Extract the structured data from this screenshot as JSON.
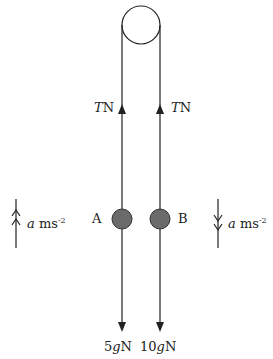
{
  "diagram": {
    "type": "pulley-system",
    "pulley": {
      "cx": 141,
      "cy": 25,
      "r": 19
    },
    "tension_left": {
      "symbol": "T",
      "unit": "N"
    },
    "tension_right": {
      "symbol": "T",
      "unit": "N"
    },
    "particle_a": {
      "label": "A",
      "color": "#6b6b6b"
    },
    "particle_b": {
      "label": "B",
      "color": "#6b6b6b"
    },
    "weight_a": {
      "coef": "5",
      "symbol": "g",
      "unit": "N"
    },
    "weight_b": {
      "coef": "10",
      "symbol": "g",
      "unit": "N"
    },
    "accel_left": {
      "symbol": "a",
      "unit": "ms",
      "exp": "-2",
      "direction": "up"
    },
    "accel_right": {
      "symbol": "a",
      "unit": "ms",
      "exp": "-2",
      "direction": "down"
    }
  }
}
